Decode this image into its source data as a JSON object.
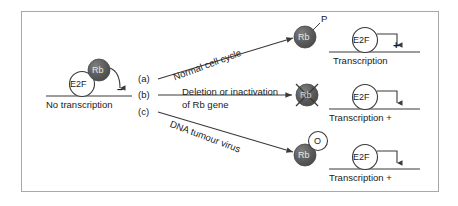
{
  "figure": {
    "border_color": "#a8a8a8",
    "background": "#ffffff",
    "rb_fill": "#5c5c5c",
    "rb_text_color": "#e8e8e8",
    "stroke_color": "#3a3a3a",
    "text_color": "#1a1a1a"
  },
  "left_panel": {
    "e2f_label": "E2F",
    "rb_label": "Rb",
    "sign": "–",
    "caption": "No transcription"
  },
  "branch_labels": {
    "a": "(a)",
    "b": "(b)",
    "c": "(c)"
  },
  "pathways": [
    {
      "id": "a",
      "label": "Normal cell cycle",
      "label_lines": [
        "Normal cell cycle"
      ],
      "direction": "up"
    },
    {
      "id": "b",
      "label": "Deletion or inactivation of Rb gene",
      "label_lines": [
        "Deletion or inactivation",
        "of Rb gene"
      ],
      "direction": "straight"
    },
    {
      "id": "c",
      "label": "DNA tumour virus",
      "label_lines": [
        "DNA tumour virus"
      ],
      "direction": "down"
    }
  ],
  "outcomes": [
    {
      "id": "a",
      "rb_label": "Rb",
      "rb_state": "phosphorylated",
      "modifier_label": "P",
      "modifier_style": "plain-text",
      "crossed_out": false,
      "e2f_label": "E2F",
      "sign": "+",
      "caption": "Transcription"
    },
    {
      "id": "b",
      "rb_label": "Rb",
      "rb_state": "deleted-or-inactivated",
      "modifier_label": "",
      "modifier_style": "none",
      "crossed_out": true,
      "e2f_label": "E2F",
      "sign": "",
      "caption": "Transcription +"
    },
    {
      "id": "c",
      "rb_label": "Rb",
      "rb_state": "bound-by-oncoprotein",
      "modifier_label": "O",
      "modifier_style": "open-circle",
      "crossed_out": false,
      "e2f_label": "E2F",
      "sign": "",
      "caption": "Transcription +"
    }
  ]
}
